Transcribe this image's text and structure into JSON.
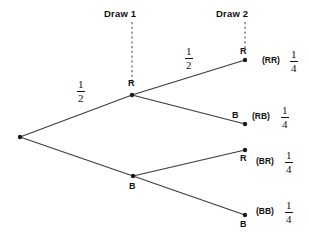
{
  "diagram": {
    "type": "probability-tree",
    "stage_labels": [
      {
        "text": "Draw 1",
        "x": 132,
        "y": 14
      },
      {
        "text": "Draw 2",
        "x": 245,
        "y": 14
      }
    ],
    "guide_lines": [
      {
        "name": "draw-1-guide",
        "x": 132,
        "y1": 22,
        "y2": 84
      },
      {
        "name": "draw-2-guide",
        "x": 245,
        "y1": 22,
        "y2": 50
      }
    ],
    "nodes": [
      {
        "id": "root",
        "label": "",
        "x": 20,
        "y": 137
      },
      {
        "id": "r1",
        "label": "R",
        "x": 132,
        "y": 95,
        "label_pos": "above"
      },
      {
        "id": "b1",
        "label": "B",
        "x": 133,
        "y": 176,
        "label_pos": "below"
      },
      {
        "id": "rr",
        "label": "R",
        "x": 245,
        "y": 60,
        "label_pos": "above-left"
      },
      {
        "id": "rb",
        "label": "B",
        "x": 245,
        "y": 124,
        "label_pos": "above-left"
      },
      {
        "id": "br",
        "label": "R",
        "x": 245,
        "y": 150,
        "label_pos": "below-left"
      },
      {
        "id": "bb",
        "label": "B",
        "x": 245,
        "y": 215,
        "label_pos": "below-left"
      }
    ],
    "edges": [
      {
        "from": "root",
        "to": "r1"
      },
      {
        "from": "root",
        "to": "b1"
      },
      {
        "from": "r1",
        "to": "rr"
      },
      {
        "from": "r1",
        "to": "rb"
      },
      {
        "from": "b1",
        "to": "br"
      },
      {
        "from": "b1",
        "to": "bb"
      }
    ],
    "branch_probabilities": [
      {
        "name": "root-to-r1",
        "numerator": "1",
        "denominator": "2",
        "x": 83,
        "y": 84
      },
      {
        "name": "r1-to-rr",
        "numerator": "1",
        "denominator": "2",
        "x": 190,
        "y": 51
      }
    ],
    "outcomes": [
      {
        "name": "rr",
        "outcome": "(RR)",
        "numerator": "1",
        "denominator": "4",
        "y": 54
      },
      {
        "name": "rb",
        "outcome": "(RB)",
        "numerator": "1",
        "denominator": "4",
        "y": 110
      },
      {
        "name": "br",
        "outcome": "(BR)",
        "numerator": "1",
        "denominator": "4",
        "y": 155
      },
      {
        "name": "bb",
        "outcome": "(BB)",
        "numerator": "1",
        "denominator": "4",
        "y": 205
      }
    ],
    "colors": {
      "line": "#3a3a3a",
      "dash": "#555555",
      "text": "#111111",
      "background": "#ffffff"
    }
  }
}
